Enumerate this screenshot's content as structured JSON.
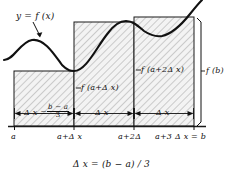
{
  "figure": {
    "kind": "riemann-sum-right-endpoint-diagram",
    "curve_label": "y = f (x)",
    "caption": "Δ x = (b − a) / 3",
    "axis": {
      "baseline_label_ticks": [
        {
          "id": "a",
          "text": "a"
        },
        {
          "id": "a-plus-dx",
          "text": "a+Δ x"
        },
        {
          "id": "a-plus-2dx",
          "text": "a+2Δ"
        },
        {
          "id": "b",
          "text": "a+3 Δ x = b"
        }
      ]
    },
    "width_labels": {
      "first": {
        "symbol": "Δ x =",
        "fraction_numerator": "b − a",
        "fraction_denominator": "3"
      },
      "second": "Δ x",
      "third": "Δ x"
    },
    "height_labels": [
      {
        "id": "f-a-plus-dx",
        "text": "f (a+Δ x)"
      },
      {
        "id": "f-a-plus-2dx",
        "text": "f (a+2Δ x)"
      },
      {
        "id": "f-b",
        "text": "f (b)"
      }
    ],
    "colors": {
      "ink": "#111111",
      "hatch": "#a8a8a8",
      "fill": "#f2f2f2",
      "background": "#ffffff"
    },
    "geometry": {
      "baseline_y": 126,
      "rects": [
        {
          "id": "rect-1",
          "x": 14,
          "width": 60,
          "top_y": 71
        },
        {
          "id": "rect-2",
          "x": 74,
          "width": 60,
          "top_y": 22
        },
        {
          "id": "rect-3",
          "x": 134,
          "width": 60,
          "top_y": 17
        }
      ]
    }
  }
}
